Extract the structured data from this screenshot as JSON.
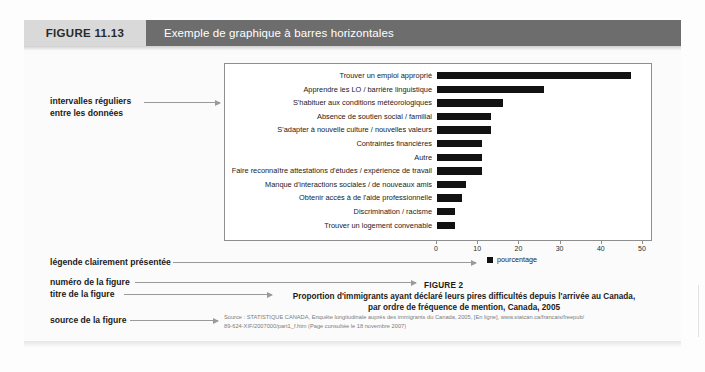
{
  "header": {
    "figure_number": "FIGURE 11.13",
    "title": "Exemple de graphique à barres horizontales",
    "number_bg": "#d9d9d9",
    "title_bg": "#6d6d6d"
  },
  "annotations": [
    {
      "name": "intervalles-reguliers",
      "line1": "intervalles réguliers",
      "line2": "entre les données"
    },
    {
      "name": "legende",
      "line1": "légende clairement présentée",
      "line2": ""
    },
    {
      "name": "numero-figure",
      "line1": "numéro de la figure",
      "line2": ""
    },
    {
      "name": "titre-figure",
      "line1": "titre de la figure",
      "line2": ""
    },
    {
      "name": "source-figure",
      "line1": "source de la figure",
      "line2": ""
    }
  ],
  "legend": {
    "label": "pourcentage",
    "color": "#111111"
  },
  "caption": {
    "figure_number": "FIGURE 2",
    "title_line1": "Proportion d'immigrants ayant déclaré leurs pires difficultés depuis l'arrivée au Canada,",
    "title_line2": "par ordre de fréquence de mention, Canada, 2005"
  },
  "source": {
    "line1": "Source : STATISTIQUE CANADA, Enquête longitudinale auprès des immigrants du Canada, 2005, [En ligne], www.statcan.ca/francais/freepub/",
    "line2": "89-624-XIF/2007000/part1_f.htm (Page consultée le 18 novembre 2007)"
  },
  "chart_data": {
    "type": "bar",
    "orientation": "horizontal",
    "title": "Proportion d'immigrants ayant déclaré leurs pires difficultés depuis l'arrivée au Canada, par ordre de fréquence de mention, Canada, 2005",
    "xlabel": "",
    "ylabel": "",
    "xlim": [
      0,
      50
    ],
    "xticks": [
      0,
      10,
      20,
      30,
      40,
      50
    ],
    "grid": false,
    "legend_position": "bottom-right",
    "series_name": "pourcentage",
    "bar_color": "#121212",
    "categories": [
      "Trouver un emploi approprié",
      "Apprendre les LO / barrière linguistique",
      "S'habituer aux conditions météorologiques",
      "Absence de soutien social / familial",
      "S'adapter à nouvelle culture / nouvelles valeurs",
      "Contraintes financières",
      "Autre",
      "Faire reconnaître attestations d'études / expérience de travail",
      "Manque d'interactions sociales / de nouveaux amis",
      "Obtenir accès à de l'aide professionnelle",
      "Discrimination / racisme",
      "Trouver un logement convenable"
    ],
    "values": [
      47,
      26,
      16,
      13,
      13,
      11,
      11,
      11,
      7,
      6,
      4.3,
      4.3
    ]
  }
}
